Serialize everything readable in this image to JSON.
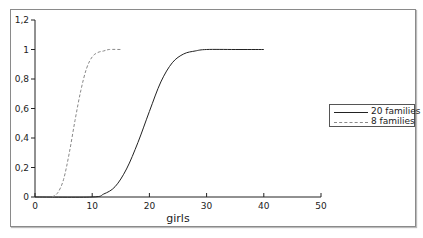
{
  "chart_data": {
    "type": "line",
    "title": "",
    "xlabel": "girls",
    "ylabel": "",
    "xlim": [
      0,
      50
    ],
    "ylim": [
      0,
      1.2
    ],
    "x_ticks": [
      "0",
      "10",
      "20",
      "30",
      "40",
      "50"
    ],
    "y_ticks": [
      "0",
      "0,2",
      "0,4",
      "0,6",
      "0,8",
      "1",
      "1,2"
    ],
    "grid": false,
    "legend_position": "right",
    "series": [
      {
        "name": "20 families",
        "style": "solid",
        "color": "#222222",
        "x": [
          0,
          10,
          12,
          14,
          16,
          18,
          20,
          22,
          24,
          26,
          28,
          30,
          35,
          40
        ],
        "values": [
          0,
          0,
          0.02,
          0.07,
          0.19,
          0.37,
          0.58,
          0.78,
          0.91,
          0.97,
          0.99,
          1.0,
          1.0,
          1.0
        ]
      },
      {
        "name": "8 families",
        "style": "dashed",
        "color": "#888888",
        "x": [
          3,
          4,
          5,
          6,
          7,
          8,
          9,
          10,
          11,
          12,
          13,
          15
        ],
        "values": [
          0,
          0.03,
          0.12,
          0.3,
          0.52,
          0.72,
          0.87,
          0.95,
          0.98,
          0.99,
          1.0,
          1.0
        ]
      }
    ]
  },
  "legend": {
    "items": [
      {
        "label": "20 families"
      },
      {
        "label": "8 families"
      }
    ]
  }
}
